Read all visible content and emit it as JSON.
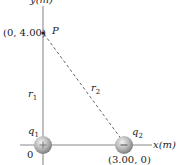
{
  "diagram": {
    "y_axis_label": "y(m)",
    "x_axis_label": "x(m)",
    "point_label": "P",
    "point_coords": "(0, 4.00)",
    "r1_label": "r",
    "r1_sub": "1",
    "r2_label": "r",
    "r2_sub": "2",
    "q1_label": "q",
    "q1_sub": "1",
    "q1_sign": "+",
    "q2_label": "q",
    "q2_sub": "2",
    "q2_sign": "−",
    "q2_coords": "(3.00, 0)",
    "origin_label": "0",
    "colors": {
      "axis": "#b0b0b0",
      "dashed": "#555555",
      "sphere": "#a8a8a8"
    }
  }
}
